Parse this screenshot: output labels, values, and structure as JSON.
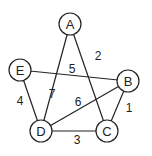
{
  "diagram": {
    "type": "weighted-undirected-graph",
    "nodes": [
      {
        "id": "A",
        "label": "A",
        "x": 70,
        "y": 24
      },
      {
        "id": "B",
        "label": "B",
        "x": 128,
        "y": 81
      },
      {
        "id": "C",
        "label": "C",
        "x": 107,
        "y": 131
      },
      {
        "id": "D",
        "label": "D",
        "x": 41,
        "y": 131
      },
      {
        "id": "E",
        "label": "E",
        "x": 20,
        "y": 70
      }
    ],
    "edges": [
      {
        "from": "A",
        "to": "C",
        "weight": "2",
        "label_x": 98,
        "label_y": 56
      },
      {
        "from": "A",
        "to": "D",
        "weight": "7",
        "label_x": 52,
        "label_y": 94
      },
      {
        "from": "E",
        "to": "B",
        "weight": "5",
        "label_x": 72,
        "label_y": 69
      },
      {
        "from": "B",
        "to": "D",
        "weight": "6",
        "label_x": 78,
        "label_y": 102
      },
      {
        "from": "B",
        "to": "C",
        "weight": "1",
        "label_x": 129,
        "label_y": 108
      },
      {
        "from": "E",
        "to": "D",
        "weight": "4",
        "label_x": 20,
        "label_y": 101
      },
      {
        "from": "D",
        "to": "C",
        "weight": "3",
        "label_x": 77,
        "label_y": 140
      }
    ],
    "node_radius": 11,
    "colors": {
      "stroke": "#222222",
      "fill": "#ffffff",
      "background": "#ffffff"
    }
  }
}
